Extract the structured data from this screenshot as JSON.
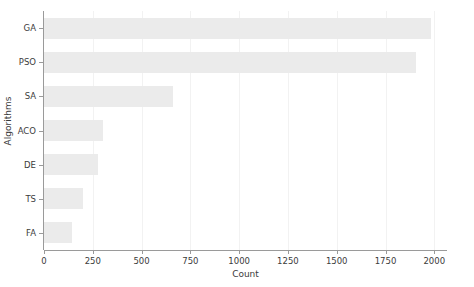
{
  "chart_data": {
    "type": "bar",
    "orientation": "horizontal",
    "title": "",
    "xlabel": "Count",
    "ylabel": "Algorithms",
    "categories": [
      "GA",
      "PSO",
      "SA",
      "ACO",
      "DE",
      "TS",
      "FA"
    ],
    "values": [
      1985,
      1905,
      660,
      300,
      278,
      199,
      144
    ],
    "xlim": [
      0,
      2060
    ],
    "xticks": [
      0,
      250,
      500,
      750,
      1000,
      1250,
      1500,
      1750,
      2000
    ],
    "xtick_labels": [
      "0",
      "250",
      "500",
      "750",
      "1000",
      "1250",
      "1500",
      "1750",
      "2000"
    ],
    "ytick_labels": [
      "GA",
      "PSO",
      "SA",
      "ACO",
      "DE",
      "TS",
      "FA"
    ],
    "grid": true,
    "grid_axis": "x",
    "legend": null,
    "bar_color": "#ebebeb",
    "axis_color": "#9a9a9a",
    "grid_color": "#f2f2f2",
    "text_color": "#3b3b3b",
    "background_color": "#ffffff"
  }
}
